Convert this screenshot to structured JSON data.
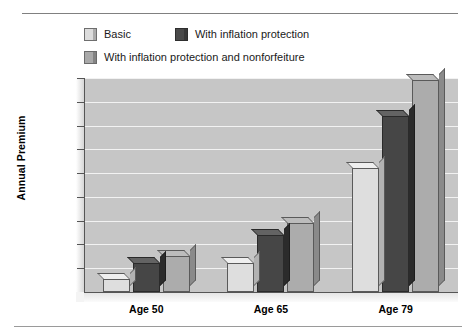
{
  "chart_data": {
    "type": "bar",
    "title": "",
    "xlabel": "",
    "ylabel": "Annual Premium",
    "categories": [
      "Age 50",
      "Age 65",
      "Age 79"
    ],
    "series": [
      {
        "name": "Basic",
        "values": [
          550,
          1200,
          5200
        ],
        "color": "#dedede"
      },
      {
        "name": "With inflation protection",
        "values": [
          1200,
          2400,
          7400
        ],
        "color": "#464646"
      },
      {
        "name": "With inflation protection and nonforfeiture",
        "values": [
          1500,
          2900,
          8900
        ],
        "color": "#acacac"
      }
    ],
    "ylim": [
      0,
      9000
    ],
    "ytick_values": [
      0,
      1000,
      2000,
      3000,
      4000,
      5000,
      6000,
      7000,
      8000,
      9000
    ],
    "ytick_labels": [
      "$0",
      "$1,000",
      "$2,000",
      "$3,000",
      "$4,000",
      "$5,000",
      "$6,000",
      "$7,000",
      "$8,000",
      "$9,000"
    ],
    "grid": true,
    "legend_position": "top",
    "plot_background": "#c6c6c6",
    "gridline_color": "#f2f2f2"
  },
  "legend": {
    "items": [
      {
        "label": "Basic",
        "swatch": "sw-basic"
      },
      {
        "label": "With inflation protection",
        "swatch": "sw-infl"
      },
      {
        "label": "With inflation protection and nonforfeiture",
        "swatch": "sw-both"
      }
    ]
  }
}
